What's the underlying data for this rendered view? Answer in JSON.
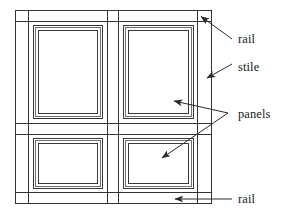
{
  "diagram": {
    "background_color": "#ffffff",
    "line_color": "#333333",
    "text_color": "#1a1a1a",
    "labels": [
      {
        "id": "rail-top",
        "text": "rail",
        "x": 238,
        "y": 43
      },
      {
        "id": "stile",
        "text": "stile",
        "x": 238,
        "y": 71
      },
      {
        "id": "panels",
        "text": "panels",
        "x": 238,
        "y": 118
      },
      {
        "id": "rail-bottom",
        "text": "rail",
        "x": 238,
        "y": 203
      }
    ],
    "components": {
      "stiles": [
        {
          "id": "left-stile",
          "x": 15,
          "y": 10,
          "width": 14,
          "height": 194
        },
        {
          "id": "center-stile",
          "x": 107,
          "y": 10,
          "width": 12,
          "height": 194
        },
        {
          "id": "right-stile",
          "x": 198,
          "y": 10,
          "width": 14,
          "height": 194
        }
      ],
      "rails": [
        {
          "id": "top-rail",
          "x": 15,
          "y": 10,
          "width": 197,
          "height": 11
        },
        {
          "id": "middle-rail",
          "x": 15,
          "y": 123,
          "width": 197,
          "height": 12
        },
        {
          "id": "bottom-rail",
          "x": 15,
          "y": 193,
          "width": 197,
          "height": 11
        }
      ],
      "panels": [
        {
          "id": "panel-upper-left",
          "x": 29,
          "y": 21,
          "width": 78,
          "height": 102
        },
        {
          "id": "panel-upper-right",
          "x": 119,
          "y": 21,
          "width": 79,
          "height": 102
        },
        {
          "id": "panel-lower-left",
          "x": 29,
          "y": 135,
          "width": 78,
          "height": 58
        },
        {
          "id": "panel-lower-right",
          "x": 119,
          "y": 135,
          "width": 79,
          "height": 58
        }
      ]
    },
    "leaders": [
      {
        "id": "leader-rail-top",
        "points": "232,39 200,16",
        "arrow_at": "200,16",
        "arrow_angle": -144
      },
      {
        "id": "leader-stile",
        "points": "232,64 206,79",
        "arrow_at": "206,79",
        "arrow_angle": 150
      },
      {
        "id": "leader-panels-upper",
        "points": "228,113 172,101",
        "arrow_at": "172,101",
        "arrow_angle": 192
      },
      {
        "id": "leader-panels-lower",
        "points": "228,113 160,160",
        "arrow_at": "160,160",
        "arrow_angle": 145
      },
      {
        "id": "leader-rail-bottom",
        "points": "232,199 173,199",
        "arrow_at": "173,199",
        "arrow_angle": 180
      }
    ]
  }
}
